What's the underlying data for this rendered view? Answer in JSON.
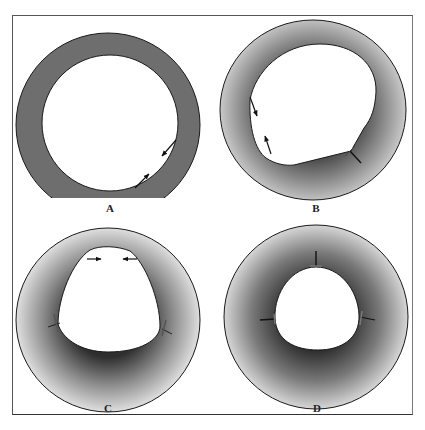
{
  "figure": {
    "panels": [
      {
        "id": "A",
        "label": "A",
        "shading": "uniform",
        "arrows": "2 opposing arrows on lower-right luminal wall"
      },
      {
        "id": "B",
        "label": "B",
        "shading": "radial",
        "arrows": "2 opposing arrows on left wall, 1 marker at lower-right notch"
      },
      {
        "id": "C",
        "label": "C",
        "shading": "radial",
        "arrows": "2 converging horizontal arrows at top, markers at left and right corners"
      },
      {
        "id": "D",
        "label": "D",
        "shading": "radial",
        "arrows": "3 inward markers at top, left and right of lumen"
      }
    ],
    "colors": {
      "frame": "#555555",
      "outline": "#1a1a1a",
      "ring_uniform": "#6e6e6e",
      "ring_dark": "#3a3a3a",
      "ring_light": "#dcdcdc",
      "lumen": "#ffffff"
    }
  }
}
